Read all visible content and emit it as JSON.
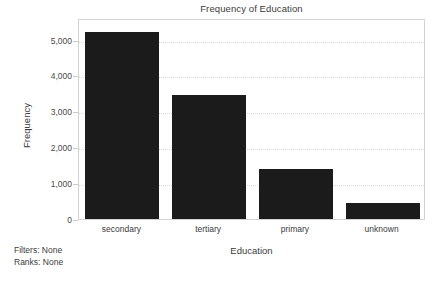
{
  "chart_data": {
    "type": "bar",
    "title": "Frequency of Education",
    "xlabel": "Education",
    "ylabel": "Frequency",
    "categories": [
      "secondary",
      "tertiary",
      "primary",
      "unknown"
    ],
    "values": [
      5200,
      3460,
      1405,
      460
    ],
    "ylim": [
      0,
      5600
    ],
    "yticks": [
      0,
      1000,
      2000,
      3000,
      4000,
      5000
    ],
    "ytick_labels": [
      "0",
      "1,000",
      "2,000",
      "3,000",
      "4,000",
      "5,000"
    ],
    "grid": true,
    "legend": null,
    "bar_color": "#1b1b1b",
    "grid_color": "#d8d8d8",
    "frame_color": "#d2d2d2",
    "background": "#ffffff"
  },
  "annotations": {
    "filters_label": "Filters: None",
    "ranks_label": "Ranks: None"
  }
}
